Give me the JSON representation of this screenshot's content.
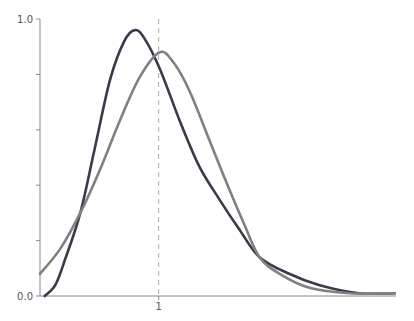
{
  "chart_data": {
    "type": "line",
    "title": "",
    "xlabel": "",
    "ylabel": "",
    "xlim": [
      0,
      3.0
    ],
    "ylim": [
      0,
      1.0
    ],
    "grid": false,
    "legend": null,
    "y_ticks": [
      0.0,
      0.2,
      0.4,
      0.6,
      0.8,
      1.0
    ],
    "y_tick_labels": [
      "0.0",
      "",
      "",
      "",
      "",
      "1.0"
    ],
    "x_ticks": [
      1
    ],
    "x_tick_labels": [
      "1"
    ],
    "reference_line": {
      "x": 1,
      "style": "dashed",
      "color": "#aaaaaa"
    },
    "series": [
      {
        "name": "dark-curve",
        "color": "#3a3a4a",
        "x": [
          0.04,
          0.13,
          0.21,
          0.34,
          0.46,
          0.59,
          0.71,
          0.8,
          0.88,
          1.01,
          1.18,
          1.34,
          1.51,
          1.68,
          1.85,
          2.1,
          2.35,
          2.69,
          2.99
        ],
        "y": [
          0.0,
          0.04,
          0.13,
          0.3,
          0.53,
          0.78,
          0.92,
          0.96,
          0.93,
          0.82,
          0.63,
          0.47,
          0.35,
          0.24,
          0.14,
          0.08,
          0.04,
          0.01,
          0.01
        ]
      },
      {
        "name": "gray-curve",
        "color": "#808080",
        "x": [
          0.0,
          0.17,
          0.34,
          0.5,
          0.67,
          0.84,
          1.01,
          1.13,
          1.26,
          1.43,
          1.6,
          1.72,
          1.85,
          2.02,
          2.27,
          2.61,
          2.99
        ],
        "y": [
          0.08,
          0.17,
          0.3,
          0.45,
          0.63,
          0.79,
          0.88,
          0.84,
          0.74,
          0.56,
          0.38,
          0.26,
          0.14,
          0.08,
          0.03,
          0.01,
          0.01
        ]
      }
    ]
  }
}
